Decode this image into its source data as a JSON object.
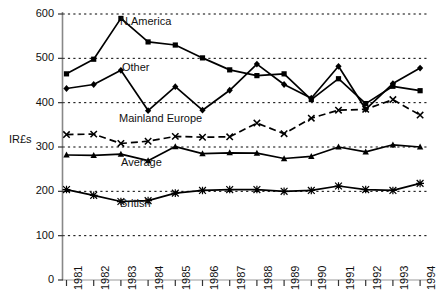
{
  "chart_data": {
    "type": "line",
    "title": "",
    "xlabel": "",
    "ylabel": "IR£s",
    "ylim": [
      0,
      600
    ],
    "yticks": [
      0,
      100,
      200,
      300,
      400,
      500,
      600
    ],
    "grid": "horizontal-dotted",
    "legend": "inline-labels",
    "categories": [
      "1981",
      "1982",
      "1983",
      "1984",
      "1985",
      "1986",
      "1987",
      "1988",
      "1989",
      "1990",
      "1991",
      "1992",
      "1993",
      "1994"
    ],
    "series": [
      {
        "name": "N.America",
        "marker": "square",
        "line": "solid",
        "values": [
          465,
          498,
          590,
          537,
          530,
          501,
          474,
          461,
          465,
          407,
          454,
          398,
          437,
          427
        ]
      },
      {
        "name": "Other",
        "marker": "diamond",
        "line": "solid",
        "values": [
          432,
          441,
          473,
          382,
          436,
          383,
          428,
          487,
          441,
          410,
          482,
          385,
          443,
          478
        ]
      },
      {
        "name": "Mainland Europe",
        "marker": "cross",
        "line": "dashed",
        "values": [
          328,
          329,
          308,
          313,
          324,
          322,
          323,
          354,
          330,
          365,
          383,
          385,
          407,
          372
        ]
      },
      {
        "name": "Average",
        "marker": "triangle",
        "line": "solid",
        "values": [
          282,
          281,
          284,
          269,
          301,
          285,
          287,
          286,
          274,
          279,
          300,
          289,
          305,
          300
        ]
      },
      {
        "name": "British",
        "marker": "star",
        "line": "solid",
        "values": [
          204,
          191,
          177,
          179,
          196,
          202,
          204,
          204,
          200,
          202,
          212,
          204,
          202,
          218
        ]
      }
    ]
  },
  "labels": {
    "y_axis_title": "IR£s",
    "series_annotations": [
      {
        "text": "N.America",
        "x": 120,
        "y": 15
      },
      {
        "text": "Other",
        "x": 122,
        "y": 61
      },
      {
        "text": "Mainland Europe",
        "x": 119,
        "y": 112
      },
      {
        "text": "Average",
        "x": 121,
        "y": 156
      },
      {
        "text": "British",
        "x": 120,
        "y": 197
      }
    ]
  }
}
